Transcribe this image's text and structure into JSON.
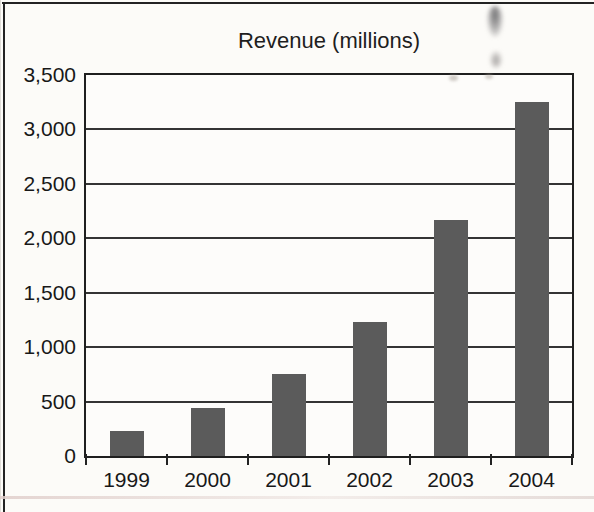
{
  "chart_data": {
    "type": "bar",
    "title": "Revenue (millions)",
    "categories": [
      "1999",
      "2000",
      "2001",
      "2002",
      "2003",
      "2004"
    ],
    "values": [
      230,
      440,
      750,
      1230,
      2170,
      3250
    ],
    "xlabel": "",
    "ylabel": "",
    "ylim": [
      0,
      3500
    ],
    "ytick_interval": 500,
    "ytick_labels": [
      "3,500",
      "3,000",
      "2,500",
      "2,000",
      "1,500",
      "1,000",
      "500",
      "0"
    ],
    "grid": true,
    "legend": false,
    "bar_color": "#5b5b5b",
    "gridline_color": "#343434",
    "border_color": "#1f1f1f"
  }
}
